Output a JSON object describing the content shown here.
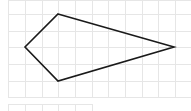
{
  "figure": {
    "type": "grid-polygon",
    "grid": {
      "cell_size": 16.7,
      "x_lines": [
        8,
        25,
        42,
        58,
        75,
        92,
        108,
        125,
        142,
        158,
        175,
        191
      ],
      "y_lines": [
        0,
        14,
        31,
        47,
        64,
        81,
        97
      ],
      "line_color": "#e6e6e6"
    },
    "lower_strip": {
      "x_lines": [
        8,
        25,
        42,
        58,
        75,
        92
      ],
      "y": [
        104,
        111
      ]
    },
    "polygon": {
      "vertices": [
        [
          58,
          14
        ],
        [
          174,
          47
        ],
        [
          58,
          81
        ],
        [
          25,
          47
        ]
      ],
      "stroke_color": "#1a1a1a",
      "stroke_width": 1.6
    }
  }
}
